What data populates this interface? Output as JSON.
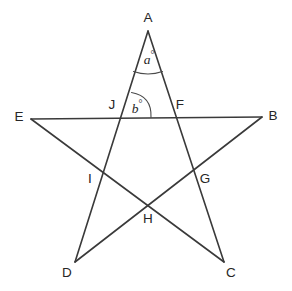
{
  "figure": {
    "background_color": "#ffffff",
    "line_color": "#3a3a3a",
    "label_color": "#262626",
    "arc_color": "#4a4a4a"
  },
  "points": {
    "A": {
      "label": "A",
      "x": 148,
      "y": 31,
      "label_x": 148,
      "label_y": 18
    },
    "B": {
      "label": "B",
      "x": 262,
      "y": 117,
      "label_x": 273,
      "label_y": 116
    },
    "C": {
      "label": "C",
      "x": 224,
      "y": 262,
      "label_x": 231,
      "label_y": 273
    },
    "D": {
      "label": "D",
      "x": 75,
      "y": 262,
      "label_x": 67,
      "label_y": 273
    },
    "E": {
      "label": "E",
      "x": 31,
      "y": 119,
      "label_x": 19,
      "label_y": 117
    },
    "F": {
      "label": "F",
      "x": 174,
      "y": 118,
      "label_x": 180,
      "label_y": 105
    },
    "G": {
      "label": "G",
      "x": 197,
      "y": 175,
      "label_x": 205,
      "label_y": 179
    },
    "H": {
      "label": "H",
      "x": 148,
      "y": 206,
      "label_x": 148,
      "label_y": 219
    },
    "I": {
      "label": "I",
      "x": 102,
      "y": 175,
      "label_x": 90,
      "label_y": 179
    },
    "J": {
      "label": "J",
      "x": 121,
      "y": 118,
      "label_x": 112,
      "label_y": 105
    }
  },
  "edges": [
    {
      "name": "edge-A-C",
      "from": "A",
      "to": "C"
    },
    {
      "name": "edge-A-D",
      "from": "A",
      "to": "D"
    },
    {
      "name": "edge-B-D",
      "from": "B",
      "to": "D"
    },
    {
      "name": "edge-C-E",
      "from": "C",
      "to": "E"
    },
    {
      "name": "edge-E-B",
      "from": "E",
      "to": "B"
    }
  ],
  "angles": [
    {
      "name": "angle-a",
      "text": "a",
      "unit": "°",
      "vertex": "A",
      "label_x": 149,
      "label_y": 58,
      "arc_path": "M 133.5 71.5 Q 148 76.5 162.5 71.5"
    },
    {
      "name": "angle-b",
      "text": "b",
      "unit": "°",
      "vertex": "J",
      "label_x": 137,
      "label_y": 107,
      "arc_path": "M 131.5 92.5 Q 152 96 151 117.5"
    }
  ],
  "chart_data": {
    "type": "diagram",
    "shape": "five-pointed star (pentagram)",
    "vertices": [
      {
        "id": "A",
        "x": 148,
        "y": 31,
        "role": "star point (top)"
      },
      {
        "id": "B",
        "x": 262,
        "y": 117,
        "role": "star point (right)"
      },
      {
        "id": "C",
        "x": 224,
        "y": 262,
        "role": "star point (bottom right)"
      },
      {
        "id": "D",
        "x": 75,
        "y": 262,
        "role": "star point (bottom left)"
      },
      {
        "id": "E",
        "x": 31,
        "y": 119,
        "role": "star point (left)"
      },
      {
        "id": "F",
        "x": 174,
        "y": 118,
        "role": "intersection of AC and EB"
      },
      {
        "id": "G",
        "x": 197,
        "y": 175,
        "role": "intersection of AC and BD"
      },
      {
        "id": "H",
        "x": 148,
        "y": 206,
        "role": "intersection of EC and BD"
      },
      {
        "id": "I",
        "x": 102,
        "y": 175,
        "role": "intersection of AD and EC"
      },
      {
        "id": "J",
        "x": 121,
        "y": 118,
        "role": "intersection of AD and EB"
      }
    ],
    "segments": [
      {
        "from": "A",
        "to": "C"
      },
      {
        "from": "A",
        "to": "D"
      },
      {
        "from": "B",
        "to": "D"
      },
      {
        "from": "C",
        "to": "E"
      },
      {
        "from": "E",
        "to": "B"
      }
    ],
    "marked_angles": [
      {
        "label": "a°",
        "at_vertex": "A",
        "between": [
          "AJ",
          "AF"
        ]
      },
      {
        "label": "b°",
        "at_vertex": "J",
        "between": [
          "JA",
          "JB"
        ]
      }
    ]
  }
}
